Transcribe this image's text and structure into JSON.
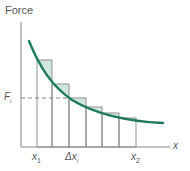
{
  "diagram": {
    "y_axis_label": "Force",
    "x_axis_label": "x",
    "fi_label": {
      "main": "F",
      "sub": "i"
    },
    "x1_label": {
      "main": "x",
      "sub": "1"
    },
    "dx_label": {
      "main": "Δx",
      "sub": "i"
    },
    "x2_label": {
      "main": "x",
      "sub": "2"
    },
    "colors": {
      "curve": "#1f7a5a",
      "fill": "#cfe8dd",
      "lines": "#777777",
      "text": "#555555"
    },
    "rectangles": [
      {
        "x0": 37,
        "x1": 52,
        "top": 60
      },
      {
        "x0": 52,
        "x1": 69,
        "top": 84
      },
      {
        "x0": 69,
        "x1": 86,
        "top": 98
      },
      {
        "x0": 86,
        "x1": 102,
        "top": 107
      },
      {
        "x0": 102,
        "x1": 119,
        "top": 113
      },
      {
        "x0": 119,
        "x1": 136,
        "top": 118
      }
    ]
  }
}
